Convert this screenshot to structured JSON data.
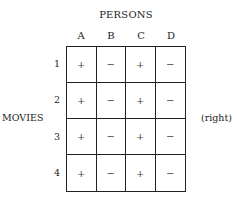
{
  "title": "PERSONS",
  "columns": [
    "A",
    "B",
    "C",
    "D"
  ],
  "rows": [
    "1",
    "2",
    "3",
    "4"
  ],
  "side_label_left": "MOVIES",
  "side_label_right": "(right)",
  "cells": [
    [
      "+",
      "−",
      "+",
      "−"
    ],
    [
      "+",
      "−",
      "+",
      "−"
    ],
    [
      "+",
      "−",
      "+",
      "−"
    ],
    [
      "+",
      "−",
      "+",
      "−"
    ]
  ]
}
